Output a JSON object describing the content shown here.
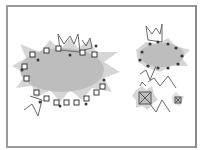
{
  "canvas": {
    "width": 202,
    "height": 150,
    "background": "#ffffff",
    "frame_color": "#9a9a9a"
  },
  "colors": {
    "burst_fill": "#bdbdbd",
    "burst_glow": "#d8d8d8",
    "outline": "#6a6a6a",
    "marker": "#3a3a3a",
    "accent_marker": "#7a3a3a"
  },
  "figures": [
    {
      "id": "large-burst",
      "cx": 60,
      "cy": 70,
      "rx": 46,
      "ry": 26
    },
    {
      "id": "medium-burst",
      "cx": 160,
      "cy": 53,
      "rx": 24,
      "ry": 14
    },
    {
      "id": "small-burst-a",
      "cx": 145,
      "cy": 98,
      "rx": 10,
      "ry": 10
    },
    {
      "id": "small-burst-b",
      "cx": 178,
      "cy": 100,
      "rx": 5,
      "ry": 5
    }
  ]
}
